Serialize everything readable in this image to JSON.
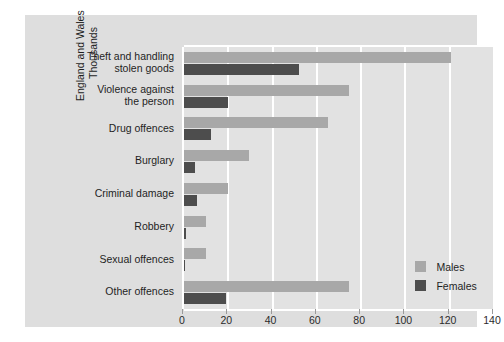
{
  "chart_data": {
    "type": "bar",
    "orientation": "horizontal",
    "title": "",
    "subtitle": "",
    "xlabel": "",
    "ylabel": "England and Wales\nThousands",
    "ylabel_lines": [
      "England and Wales",
      "Thousands"
    ],
    "categories": [
      "Theft and handling\nstolen goods",
      "Violence against\nthe person",
      "Drug offences",
      "Burglary",
      "Criminal damage",
      "Robbery",
      "Sexual offences",
      "Other offences"
    ],
    "series": [
      {
        "name": "Males",
        "color": "#a8a8a8",
        "values": [
          120.5,
          74.5,
          65,
          29.5,
          20,
          10,
          10,
          74.5
        ]
      },
      {
        "name": "Females",
        "color": "#4d4d4d",
        "values": [
          52,
          20,
          12,
          5,
          6,
          1,
          0.5,
          19
        ]
      }
    ],
    "xlim": [
      0,
      140
    ],
    "xticks": [
      0,
      20,
      40,
      60,
      80,
      100,
      120,
      140
    ],
    "xtick_labels": [
      "0",
      "20",
      "40",
      "60",
      "80",
      "100",
      "120",
      "140"
    ],
    "grid": true,
    "grid_axis": "x",
    "legend_position": "bottom-right"
  },
  "legend": {
    "items": [
      {
        "label": "Males",
        "color": "#a8a8a8"
      },
      {
        "label": "Females",
        "color": "#4d4d4d"
      }
    ]
  },
  "side_caption": "",
  "colors": {
    "background": "#ffffff",
    "card": "#dedede",
    "plot": "#e2e2e2",
    "grid": "#ffffff",
    "males": "#a8a8a8",
    "females": "#4d4d4d",
    "text": "#1f1f1f"
  }
}
